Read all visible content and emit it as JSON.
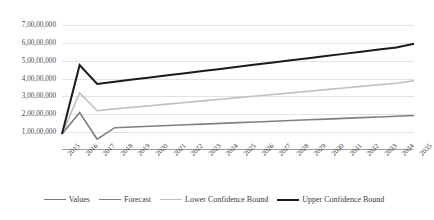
{
  "chart_data": {
    "type": "line",
    "title": "",
    "xlabel": "",
    "ylabel": "",
    "ylim": [
      0,
      75000000
    ],
    "ytick_values": [
      10000000,
      20000000,
      30000000,
      40000000,
      50000000,
      60000000,
      70000000
    ],
    "ytick_labels": [
      "1,00,00,000",
      "2,00,00,000",
      "3,00,00,000",
      "4,00,00,000",
      "5,00,00,000",
      "6,00,00,000",
      "7,00,00,000"
    ],
    "grid": true,
    "legend_position": "bottom",
    "categories": [
      "2015",
      "2016",
      "2017",
      "2018",
      "2019",
      "2020",
      "2021",
      "2022",
      "2023",
      "2024",
      "2025",
      "2026",
      "2027",
      "2028",
      "2029",
      "2030",
      "2031",
      "2032",
      "2033",
      "2034",
      "2035"
    ],
    "series": [
      {
        "name": "Values",
        "color": "#7a7a7a",
        "width": 1.6,
        "values": [
          9000000,
          21000000,
          6000000,
          null,
          null,
          null,
          null,
          null,
          null,
          null,
          null,
          null,
          null,
          null,
          null,
          null,
          null,
          null,
          null,
          null,
          null
        ]
      },
      {
        "name": "Forecast",
        "color": "#808080",
        "width": 1.6,
        "values": [
          null,
          null,
          6000000,
          12500000,
          12900000,
          13300000,
          13700000,
          14100000,
          14500000,
          14900000,
          15300000,
          15700000,
          16100000,
          16500000,
          16900000,
          17300000,
          17700000,
          18100000,
          18500000,
          18900000,
          19300000
        ]
      },
      {
        "name": "Lower Confidence Bound",
        "color": "#bfbfbf",
        "width": 1.6,
        "values": [
          9000000,
          32000000,
          22000000,
          23000000,
          23900000,
          24800000,
          25700000,
          26600000,
          27500000,
          28400000,
          29300000,
          30200000,
          31100000,
          32000000,
          32900000,
          33800000,
          34700000,
          35600000,
          36500000,
          37400000,
          38800000
        ]
      },
      {
        "name": "Upper Confidence Bound",
        "color": "#1a1a1a",
        "width": 2.0,
        "values": [
          9000000,
          47500000,
          37000000,
          38200000,
          39400000,
          40600000,
          41800000,
          43000000,
          44200000,
          45400000,
          46600000,
          47800000,
          49000000,
          50200000,
          51400000,
          52600000,
          53800000,
          55000000,
          56200000,
          57400000,
          59500000
        ]
      }
    ]
  },
  "legend": {
    "items": [
      {
        "label": "Values",
        "color": "#7a7a7a"
      },
      {
        "label": "Forecast",
        "color": "#808080"
      },
      {
        "label": "Lower Confidence Bound",
        "color": "#bfbfbf"
      },
      {
        "label": "Upper Confidence Bound",
        "color": "#1a1a1a"
      }
    ]
  }
}
